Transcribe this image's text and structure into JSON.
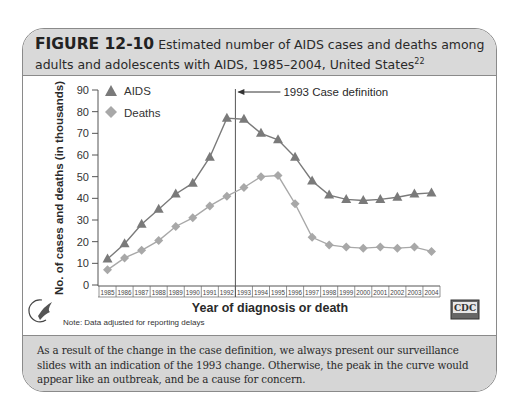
{
  "figure": {
    "number": "FIGURE 12-10",
    "title": "Estimated number of AIDS cases and deaths among adults and adolescents with AIDS, 1985–2004, United States",
    "title_ref": "22",
    "note": "Note: Data adjusted for reporting delays",
    "caption": "As a result of the change in the case definition, we always present our surveillance slides with an indication of the 1993 change. Otherwise, the peak in the curve would appear like an outbreak, and be a cause for concern.",
    "logos": {
      "left": "hhs-eagle-logo",
      "right": "CDC"
    }
  },
  "colors": {
    "header_bg": "#d9d9d9",
    "caption_bg": "#d6d6d6",
    "border": "#8a8a8a",
    "aids_series": "#7a7a7a",
    "deaths_series": "#a8a8a8"
  },
  "chart_data": {
    "type": "line",
    "title": "Estimated number of AIDS cases and deaths among adults and adolescents with AIDS, 1985–2004, United States",
    "xlabel": "Year of diagnosis or death",
    "ylabel": "No. of cases and deaths (in thousands)",
    "ylim": [
      0,
      90
    ],
    "yticks": [
      0,
      10,
      20,
      30,
      40,
      50,
      60,
      70,
      80,
      90
    ],
    "grid": false,
    "legend_position": "upper-left",
    "categories": [
      "1985",
      "1986",
      "1987",
      "1988",
      "1989",
      "1990",
      "1991",
      "1992",
      "1993",
      "1994",
      "1995",
      "1996",
      "1997",
      "1998",
      "1999",
      "2000",
      "2001",
      "2002",
      "2003",
      "2004"
    ],
    "series": [
      {
        "name": "AIDS",
        "marker": "triangle",
        "values": [
          12,
          19,
          28,
          35,
          42,
          47,
          59,
          77,
          76.5,
          70,
          67,
          59,
          48,
          41.5,
          39.5,
          39,
          39.5,
          40.5,
          42,
          42.5
        ]
      },
      {
        "name": "Deaths",
        "marker": "diamond",
        "values": [
          7,
          12.5,
          16,
          20.5,
          27,
          31,
          36.5,
          41,
          45,
          50,
          50.5,
          37.5,
          22,
          18.5,
          17.5,
          17,
          17.5,
          17,
          17.5,
          15.5
        ]
      }
    ],
    "annotations": [
      {
        "type": "vline",
        "x": "1993",
        "position": "between 1992 and 1993",
        "label": "1993 Case definition"
      }
    ]
  }
}
